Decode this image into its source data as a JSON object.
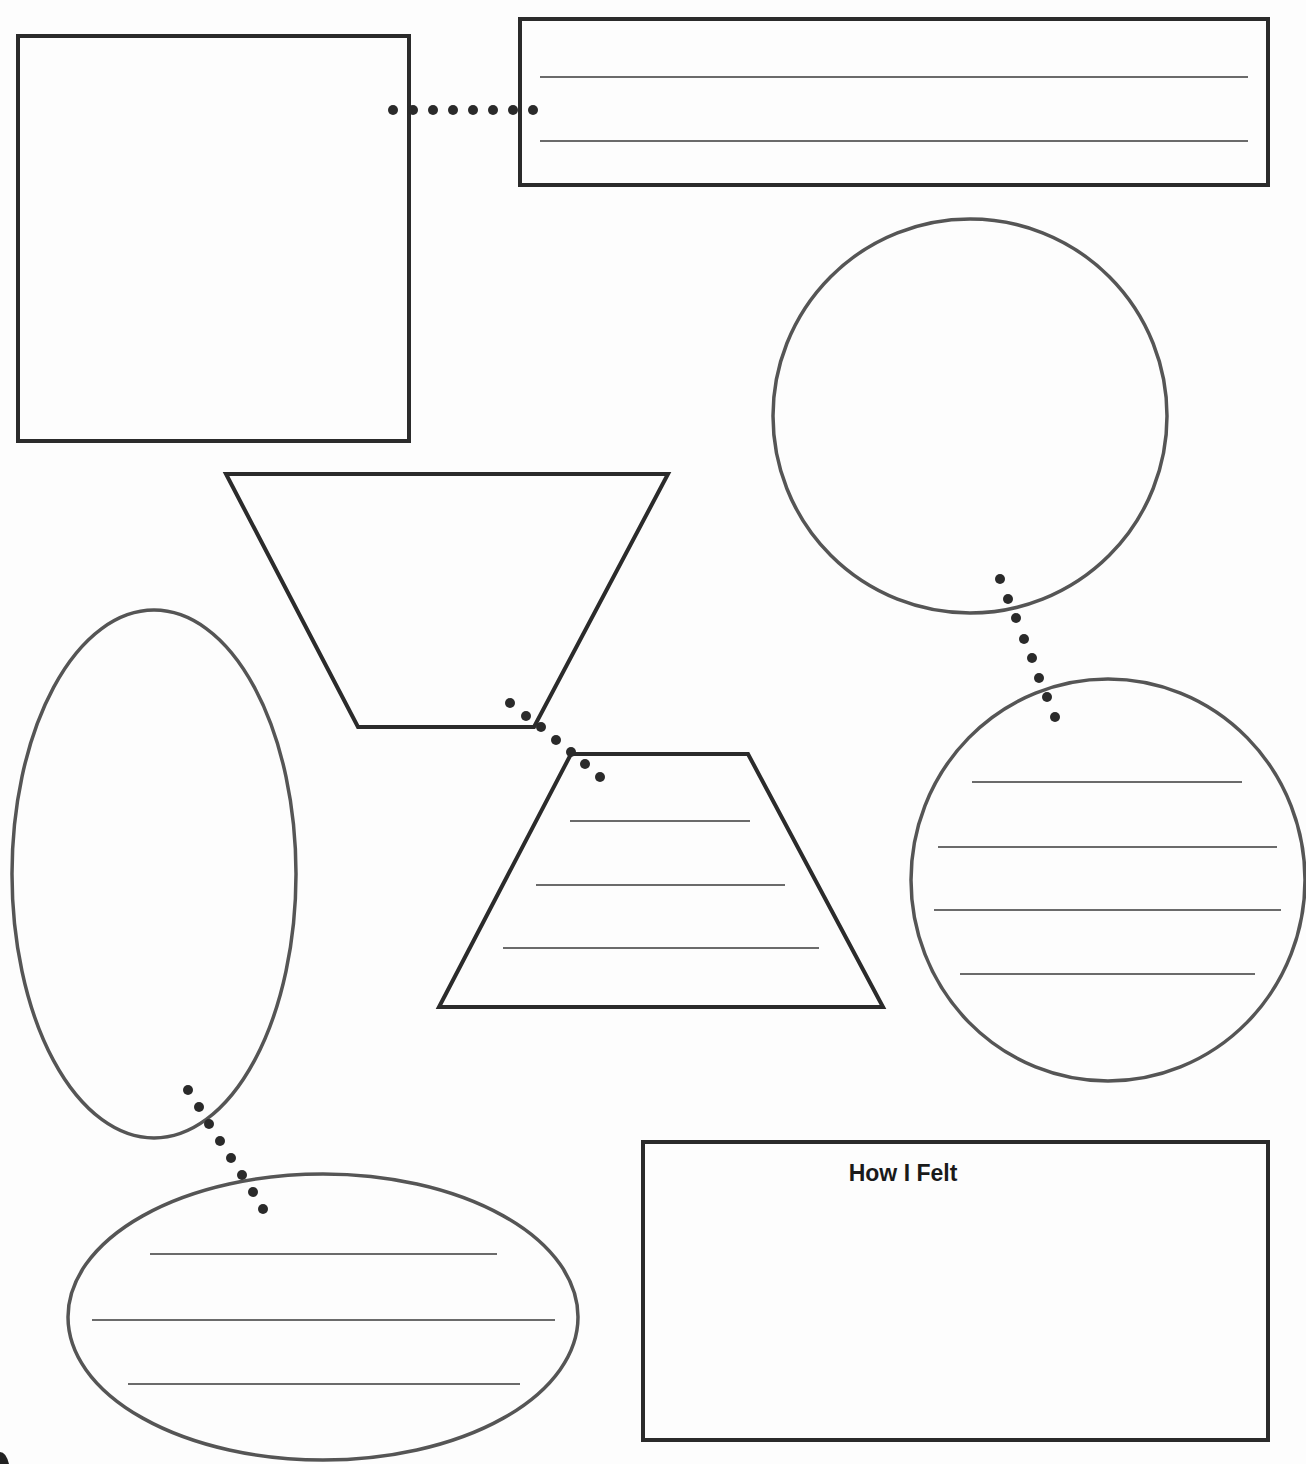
{
  "worksheet": {
    "colors": {
      "box_stroke": "#2b2b2b",
      "round_stroke": "#555555",
      "rule_line": "#3a3a3a",
      "dot": "#2a2a2a",
      "paper": "#fdfdfd"
    },
    "shapes": {
      "top_left_box": {
        "x": 18,
        "y": 36,
        "w": 391,
        "h": 405,
        "lines": []
      },
      "top_right_box": {
        "x": 520,
        "y": 19,
        "w": 748,
        "h": 166,
        "lines": [
          [
            540,
            1248,
            77
          ],
          [
            540,
            1248,
            141
          ]
        ]
      },
      "upper_trapezoid": {
        "points": "226,474 668,474 534,727 358,727",
        "lines": []
      },
      "lower_trapezoid": {
        "points": "571,754 748,754 883,1007 439,1007",
        "lines": [
          [
            570,
            750,
            821
          ],
          [
            536,
            785,
            885
          ],
          [
            503,
            819,
            948
          ]
        ]
      },
      "how_i_felt_box": {
        "x": 643,
        "y": 1142,
        "w": 625,
        "h": 298
      },
      "upper_circle": {
        "cx": 970,
        "cy": 416,
        "r": 197
      },
      "lower_circle": {
        "cx": 1108,
        "cy": 880,
        "rx": 197,
        "ry": 201,
        "lines": [
          [
            972,
            1242,
            782
          ],
          [
            938,
            1277,
            847
          ],
          [
            934,
            1281,
            910
          ],
          [
            960,
            1255,
            974
          ]
        ]
      },
      "tall_ellipse": {
        "cx": 154,
        "cy": 874,
        "rx": 142,
        "ry": 264
      },
      "wide_ellipse": {
        "cx": 323,
        "cy": 1317,
        "rx": 255,
        "ry": 143,
        "lines": [
          [
            150,
            497,
            1254
          ],
          [
            92,
            555,
            1320
          ],
          [
            128,
            520,
            1384
          ]
        ]
      }
    },
    "connectors": {
      "box_to_banner": [
        [
          393,
          110
        ],
        [
          413,
          110
        ],
        [
          433,
          110
        ],
        [
          453,
          110
        ],
        [
          473,
          110
        ],
        [
          493,
          110
        ],
        [
          513,
          110
        ],
        [
          533,
          110
        ]
      ],
      "trapezoid_join": [
        [
          510,
          703
        ],
        [
          526,
          716
        ],
        [
          541,
          727
        ],
        [
          556,
          740
        ],
        [
          571,
          752
        ],
        [
          585,
          764
        ],
        [
          600,
          777
        ]
      ],
      "circle_to_circle": [
        [
          1000,
          579
        ],
        [
          1008,
          599
        ],
        [
          1016,
          618
        ],
        [
          1024,
          639
        ],
        [
          1032,
          658
        ],
        [
          1039,
          678
        ],
        [
          1047,
          697
        ],
        [
          1055,
          717
        ]
      ],
      "ellipse_to_ellipse": [
        [
          188,
          1090
        ],
        [
          199,
          1107
        ],
        [
          209,
          1124
        ],
        [
          220,
          1141
        ],
        [
          231,
          1158
        ],
        [
          242,
          1175
        ],
        [
          253,
          1192
        ],
        [
          263,
          1209
        ]
      ]
    },
    "labels": {
      "how_i_felt": "How I Felt"
    }
  }
}
